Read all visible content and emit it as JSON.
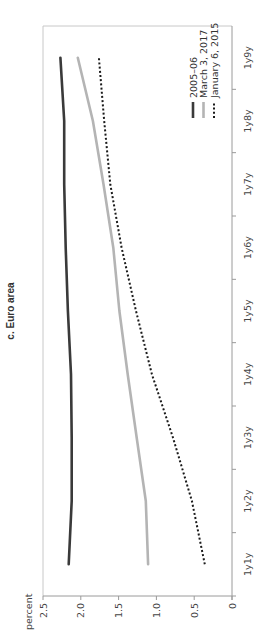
{
  "chart_data": {
    "type": "line",
    "title": "c. Euro area",
    "xlabel": "",
    "ylabel": "percent",
    "ylim": [
      0,
      2.5
    ],
    "yticks": [
      "0",
      "0.5",
      "1.0",
      "1.5",
      "2.0",
      "2.5"
    ],
    "ytick_values": [
      0,
      0.5,
      1.0,
      1.5,
      2.0,
      2.5
    ],
    "categories": [
      "1y1y",
      "1y2y",
      "1y3y",
      "1y4y",
      "1y5y",
      "1y6y",
      "1y7y",
      "1y8y",
      "1y9y"
    ],
    "grid": false,
    "legend_position": "top-right",
    "series": [
      {
        "name": "2005–06",
        "style": "solid",
        "color": "#3a3a3a",
        "values": [
          2.16,
          2.12,
          2.12,
          2.13,
          2.17,
          2.2,
          2.22,
          2.22,
          2.27
        ]
      },
      {
        "name": "March 3, 2017",
        "style": "solid",
        "color": "#b4b4b4",
        "values": [
          1.11,
          1.14,
          1.26,
          1.38,
          1.49,
          1.57,
          1.7,
          1.84,
          2.04
        ]
      },
      {
        "name": "January 6, 2015",
        "style": "dotted",
        "color": "#1a1a1a",
        "values": [
          0.36,
          0.53,
          0.78,
          1.06,
          1.27,
          1.46,
          1.61,
          1.69,
          1.76
        ]
      }
    ]
  }
}
